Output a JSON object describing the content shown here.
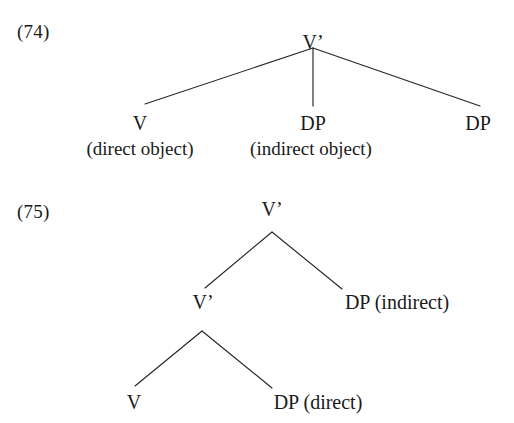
{
  "page": {
    "width": 514,
    "height": 423,
    "background": "#ffffff",
    "ink_color": "#1a1a1a",
    "line_color": "#262626",
    "content_type": "linguistics-syntax-tree-diagrams"
  },
  "examples": [
    {
      "id": "example-74",
      "number_label": "(74)",
      "description": "Flat ternary-branching V-bar structure",
      "nodes": {
        "root": {
          "label": "V’",
          "x": 313,
          "y": 32
        },
        "leaves": [
          {
            "label": "V",
            "sublabel": "(direct object)",
            "x": 140,
            "y": 127,
            "sub_y": 152
          },
          {
            "label": "DP",
            "sublabel": "(indirect object)",
            "x": 311,
            "y": 127,
            "sub_y": 152
          },
          {
            "label": "DP",
            "sublabel": "",
            "x": 478,
            "y": 127,
            "sub_y": 152
          }
        ]
      },
      "branches": [
        {
          "from": [
            313,
            48
          ],
          "to": [
            145,
            104
          ]
        },
        {
          "from": [
            313,
            48
          ],
          "to": [
            313,
            106
          ]
        },
        {
          "from": [
            313,
            48
          ],
          "to": [
            480,
            106
          ]
        }
      ]
    },
    {
      "id": "example-75",
      "number_label": "(75)",
      "description": "Binary-branching shell structure with recursive V-bar",
      "nodes": {
        "root": {
          "label": "V’",
          "x": 272,
          "y": 212
        },
        "mid": {
          "label": "V’",
          "x": 203,
          "y": 309
        },
        "right": {
          "label": "DP (indirect)",
          "x": 397,
          "y": 309
        },
        "leaves": [
          {
            "label": "V",
            "x": 134,
            "y": 408
          },
          {
            "label": "DP (direct)",
            "x": 318,
            "y": 408
          }
        ]
      },
      "branches": [
        {
          "from": [
            272,
            232
          ],
          "to": [
            205,
            288
          ]
        },
        {
          "from": [
            272,
            232
          ],
          "to": [
            342,
            289
          ]
        },
        {
          "from": [
            202,
            331
          ],
          "to": [
            135,
            386
          ]
        },
        {
          "from": [
            202,
            331
          ],
          "to": [
            272,
            388
          ]
        }
      ]
    }
  ]
}
